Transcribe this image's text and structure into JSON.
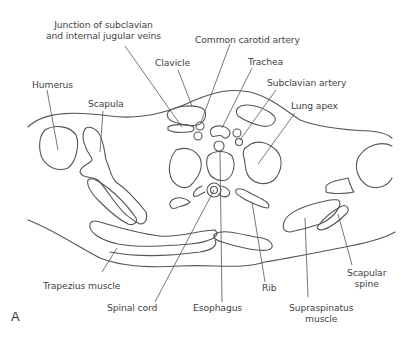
{
  "figure": {
    "panel_letter": "A",
    "line_color": "#555555",
    "labels": {
      "junction": [
        "Junction of subclavian",
        "and internal jugular veins"
      ],
      "common_carotid": "Common carotid artery",
      "clavicle": "Clavicle",
      "trachea": "Trachea",
      "subclavian_artery": "Subclavian artery",
      "humerus": "Humerus",
      "scapula": "Scapula",
      "lung_apex": "Lung apex",
      "trapezius": "Trapezius muscle",
      "spinal_cord": "Spinal cord",
      "esophagus": "Esophagus",
      "rib": "Rib",
      "supraspinatus": [
        "Supraspinatus",
        "muscle"
      ],
      "scapular_spine": [
        "Scapular",
        "spine"
      ]
    }
  }
}
